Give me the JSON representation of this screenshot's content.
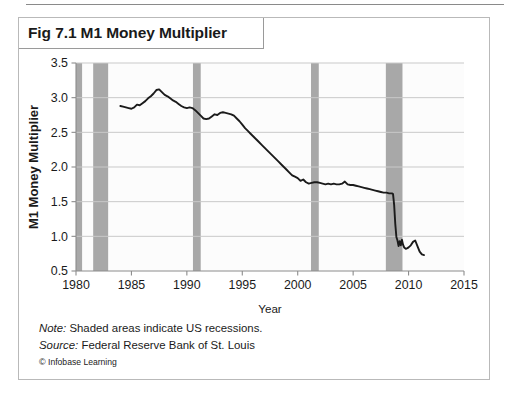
{
  "figure": {
    "title": "Fig 7.1 M1 Money Multiplier",
    "note_label": "Note:",
    "note_text": " Shaded areas indicate US recessions.",
    "source_label": "Source:",
    "source_text": " Federal Reserve Bank of St. Louis",
    "copyright_mark": "©",
    "copyright_text": " Infobase Learning"
  },
  "colors": {
    "line": "#1b1b1b",
    "recession_band": "#a8a8a8",
    "gridline": "#c9c9c9",
    "axis": "#8c8c8c",
    "plot_background": "#fcfcfc",
    "panel_border": "#b9b9b9",
    "text": "#1a1a1a"
  },
  "chart_data": {
    "type": "line",
    "title": "Fig 7.1 M1 Money Multiplier",
    "xlabel": "Year",
    "ylabel": "M1 Money Multiplier",
    "xlim": [
      1980,
      2015
    ],
    "ylim": [
      0.5,
      3.5
    ],
    "xticks": [
      1980,
      1985,
      1990,
      1995,
      2000,
      2005,
      2010,
      2015
    ],
    "yticks": [
      0.5,
      1.0,
      1.5,
      2.0,
      2.5,
      3.0,
      3.5
    ],
    "xtick_labels": [
      "1980",
      "1985",
      "1990",
      "1995",
      "2000",
      "2005",
      "2010",
      "2015"
    ],
    "ytick_labels": [
      "0.5",
      "1.0",
      "1.5",
      "2.0",
      "2.5",
      "3.0",
      "3.5"
    ],
    "grid": true,
    "legend": false,
    "series": [
      {
        "name": "M1 Money Multiplier",
        "x": [
          1984.0,
          1984.25,
          1984.5,
          1984.75,
          1985.0,
          1985.25,
          1985.5,
          1985.75,
          1986.0,
          1986.25,
          1986.5,
          1986.75,
          1987.0,
          1987.25,
          1987.5,
          1987.75,
          1988.0,
          1988.25,
          1988.5,
          1988.75,
          1989.0,
          1989.25,
          1989.5,
          1989.75,
          1990.0,
          1990.25,
          1990.5,
          1990.75,
          1991.0,
          1991.25,
          1991.5,
          1991.75,
          1992.0,
          1992.25,
          1992.5,
          1992.75,
          1993.0,
          1993.25,
          1993.5,
          1993.75,
          1994.0,
          1994.25,
          1994.5,
          1994.75,
          1995.0,
          1995.25,
          1995.5,
          1995.75,
          1996.0,
          1996.25,
          1996.5,
          1996.75,
          1997.0,
          1997.25,
          1997.5,
          1997.75,
          1998.0,
          1998.25,
          1998.5,
          1998.75,
          1999.0,
          1999.25,
          1999.5,
          1999.75,
          2000.0,
          2000.25,
          2000.5,
          2000.75,
          2001.0,
          2001.25,
          2001.5,
          2001.75,
          2002.0,
          2002.25,
          2002.5,
          2002.75,
          2003.0,
          2003.25,
          2003.5,
          2003.75,
          2004.0,
          2004.25,
          2004.5,
          2004.75,
          2005.0,
          2005.25,
          2005.5,
          2005.75,
          2006.0,
          2006.25,
          2006.5,
          2006.75,
          2007.0,
          2007.25,
          2007.5,
          2007.75,
          2008.0,
          2008.25,
          2008.5,
          2008.6,
          2008.7,
          2008.8,
          2008.9,
          2009.0,
          2009.1,
          2009.2,
          2009.3,
          2009.4,
          2009.5,
          2009.6,
          2009.75,
          2009.9,
          2010.0,
          2010.2,
          2010.4,
          2010.6,
          2010.8,
          2011.0,
          2011.2,
          2011.4
        ],
        "values": [
          2.88,
          2.87,
          2.86,
          2.85,
          2.84,
          2.86,
          2.9,
          2.89,
          2.92,
          2.95,
          2.99,
          3.02,
          3.06,
          3.11,
          3.12,
          3.08,
          3.04,
          3.02,
          2.99,
          2.96,
          2.94,
          2.91,
          2.88,
          2.86,
          2.85,
          2.86,
          2.85,
          2.82,
          2.78,
          2.74,
          2.7,
          2.69,
          2.7,
          2.73,
          2.76,
          2.75,
          2.78,
          2.79,
          2.78,
          2.77,
          2.76,
          2.74,
          2.7,
          2.66,
          2.61,
          2.56,
          2.52,
          2.48,
          2.44,
          2.4,
          2.36,
          2.32,
          2.28,
          2.24,
          2.2,
          2.16,
          2.12,
          2.08,
          2.04,
          2.0,
          1.96,
          1.92,
          1.88,
          1.86,
          1.84,
          1.8,
          1.82,
          1.78,
          1.76,
          1.77,
          1.78,
          1.78,
          1.77,
          1.76,
          1.75,
          1.76,
          1.75,
          1.76,
          1.75,
          1.75,
          1.76,
          1.79,
          1.75,
          1.74,
          1.74,
          1.73,
          1.72,
          1.71,
          1.7,
          1.69,
          1.68,
          1.67,
          1.66,
          1.65,
          1.64,
          1.63,
          1.63,
          1.62,
          1.62,
          1.61,
          1.45,
          1.18,
          0.99,
          0.94,
          0.86,
          0.93,
          0.87,
          0.95,
          0.88,
          0.84,
          0.82,
          0.83,
          0.84,
          0.87,
          0.92,
          0.94,
          0.86,
          0.78,
          0.74,
          0.73
        ]
      }
    ],
    "recession_bands": [
      {
        "start": 1980.0,
        "end": 1980.55,
        "label": "1980 recession"
      },
      {
        "start": 1981.55,
        "end": 1982.9,
        "label": "1981-1982 recession"
      },
      {
        "start": 1990.55,
        "end": 1991.25,
        "label": "1990-1991 recession"
      },
      {
        "start": 2001.2,
        "end": 2001.9,
        "label": "2001 recession"
      },
      {
        "start": 2007.95,
        "end": 2009.45,
        "label": "2007-2009 recession"
      }
    ],
    "annotations": [
      "Shaded areas indicate US recessions."
    ]
  }
}
